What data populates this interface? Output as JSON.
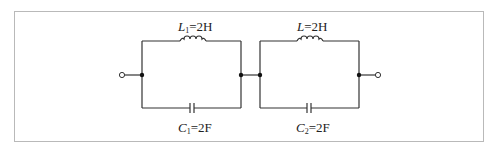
{
  "diagram": {
    "type": "circuit",
    "stroke_color": "#333333",
    "border_color": "#b9b9b9",
    "stages": [
      {
        "inductor": {
          "symbol": "L",
          "subscript": "1",
          "value": "=2H"
        },
        "capacitor": {
          "symbol": "C",
          "subscript": "1",
          "value": "=2F"
        }
      },
      {
        "inductor": {
          "symbol": "L",
          "subscript": "",
          "value": "=2H"
        },
        "capacitor": {
          "symbol": "C",
          "subscript": "2",
          "value": "=2F"
        }
      }
    ],
    "terminals": [
      {
        "name": "input-terminal",
        "icon": "open-circle-terminal"
      },
      {
        "name": "output-terminal",
        "icon": "open-circle-terminal"
      }
    ]
  }
}
